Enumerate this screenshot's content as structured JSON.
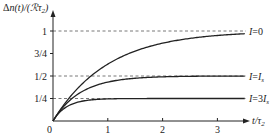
{
  "chart_data": {
    "type": "line",
    "title": "",
    "ylabel": "Δn(t)/(ℛτ₂)",
    "xlabel": "t/τ₂",
    "xlim": [
      0,
      3.5
    ],
    "ylim": [
      0,
      1.08
    ],
    "grid": false,
    "legend_position": "inline-right",
    "x_ticks": [
      {
        "value": 0,
        "label": "0"
      },
      {
        "value": 1,
        "label": "1"
      },
      {
        "value": 2,
        "label": "2"
      },
      {
        "value": 3,
        "label": "3"
      }
    ],
    "y_ticks": [
      {
        "value": 1,
        "label": "1"
      },
      {
        "value": 0.75,
        "label": "3/4"
      },
      {
        "value": 0.5,
        "label": "1/2"
      },
      {
        "value": 0.25,
        "label": "1/4"
      }
    ],
    "dashed_guides": [
      1,
      0.5,
      0.25
    ],
    "series": [
      {
        "name": "I=0",
        "label_main": "I",
        "label_rest": "=0",
        "saturation": 1,
        "rate": 1,
        "x": [
          0,
          0.25,
          0.5,
          0.75,
          1,
          1.5,
          2,
          2.5,
          3,
          3.5
        ],
        "values": [
          0,
          0.22,
          0.39,
          0.53,
          0.63,
          0.78,
          0.86,
          0.92,
          0.95,
          0.97
        ]
      },
      {
        "name": "I=I_s",
        "label_main": "I",
        "label_rest": "=I",
        "label_sub": "s",
        "saturation": 0.5,
        "rate": 2,
        "x": [
          0,
          0.25,
          0.5,
          0.75,
          1,
          1.5,
          2,
          2.5,
          3,
          3.5
        ],
        "values": [
          0,
          0.2,
          0.32,
          0.39,
          0.43,
          0.48,
          0.49,
          0.5,
          0.5,
          0.5
        ]
      },
      {
        "name": "I=3I_s",
        "label_main": "I",
        "label_rest": "=3I",
        "label_sub": "s",
        "saturation": 0.25,
        "rate": 4,
        "x": [
          0,
          0.25,
          0.5,
          0.75,
          1,
          1.5,
          2,
          2.5,
          3,
          3.5
        ],
        "values": [
          0,
          0.16,
          0.22,
          0.24,
          0.25,
          0.25,
          0.25,
          0.25,
          0.25,
          0.25
        ]
      }
    ]
  },
  "axes": {
    "y_label_prefix": "Δ",
    "y_label_n": "n",
    "y_label_mid": "(t)/(ℛτ",
    "y_label_sub": "2",
    "y_label_end": ")",
    "x_label_t": "t",
    "x_label_mid": "/τ",
    "x_label_sub": "2",
    "origin_label": "0"
  }
}
